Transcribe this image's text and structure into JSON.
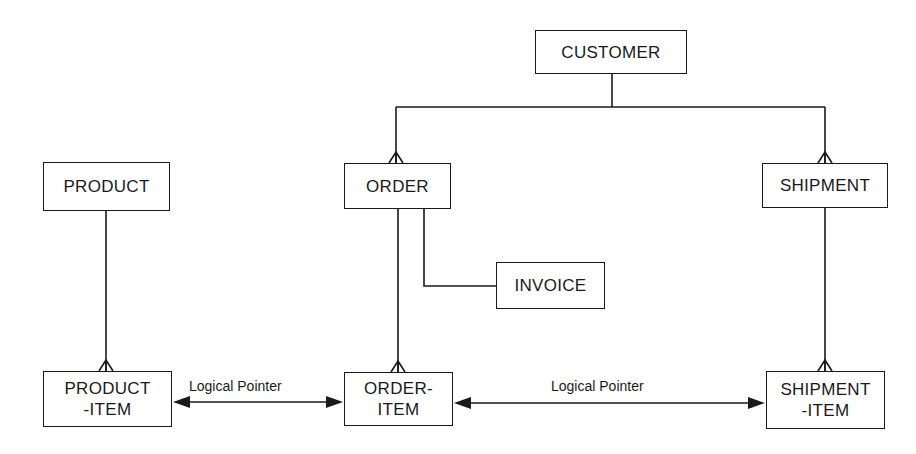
{
  "diagram": {
    "type": "data-structure-diagram",
    "entities": {
      "customer": {
        "lines": [
          "CUSTOMER"
        ]
      },
      "product": {
        "lines": [
          "PRODUCT"
        ]
      },
      "order": {
        "lines": [
          "ORDER"
        ]
      },
      "shipment": {
        "lines": [
          "SHIPMENT"
        ]
      },
      "invoice": {
        "lines": [
          "INVOICE"
        ]
      },
      "product_item": {
        "lines": [
          "PRODUCT",
          "-ITEM"
        ]
      },
      "order_item": {
        "lines": [
          "ORDER-",
          "ITEM"
        ]
      },
      "shipment_item": {
        "lines": [
          "SHIPMENT",
          "-ITEM"
        ]
      }
    },
    "relationships": [
      {
        "from": "CUSTOMER",
        "to": "ORDER",
        "cardinality": "one-to-many"
      },
      {
        "from": "CUSTOMER",
        "to": "SHIPMENT",
        "cardinality": "one-to-many"
      },
      {
        "from": "PRODUCT",
        "to": "PRODUCT-ITEM",
        "cardinality": "one-to-many"
      },
      {
        "from": "ORDER",
        "to": "ORDER-ITEM",
        "cardinality": "one-to-many"
      },
      {
        "from": "ORDER",
        "to": "INVOICE",
        "cardinality": "one-to-one"
      },
      {
        "from": "SHIPMENT",
        "to": "SHIPMENT-ITEM",
        "cardinality": "one-to-many"
      }
    ],
    "pointers": {
      "left": {
        "label": "Logical Pointer",
        "between": [
          "PRODUCT-ITEM",
          "ORDER-ITEM"
        ]
      },
      "right": {
        "label": "Logical Pointer",
        "between": [
          "ORDER-ITEM",
          "SHIPMENT-ITEM"
        ]
      }
    },
    "colors": {
      "ink": "#1a1a1a",
      "background": "#ffffff"
    }
  }
}
